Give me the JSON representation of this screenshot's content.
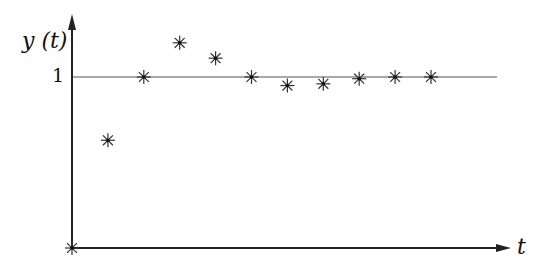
{
  "chart_data": {
    "type": "scatter",
    "title": "",
    "xlabel": "t",
    "ylabel": "y(t)",
    "y_ticks": [
      "1"
    ],
    "reference_line": {
      "y": 1
    },
    "marker": "asterisk",
    "x": [
      0,
      1,
      2,
      3,
      4,
      5,
      6,
      7,
      8,
      9,
      10
    ],
    "values": [
      0,
      0.63,
      1.0,
      1.2,
      1.11,
      1.0,
      0.95,
      0.96,
      0.99,
      1.0,
      1.0
    ],
    "ylim": [
      0,
      1.35
    ],
    "xlim": [
      0,
      12.5
    ],
    "grid": false,
    "legend": null
  },
  "labels": {
    "y_axis": "y (t)",
    "x_axis": "t",
    "tick_one": "1"
  }
}
